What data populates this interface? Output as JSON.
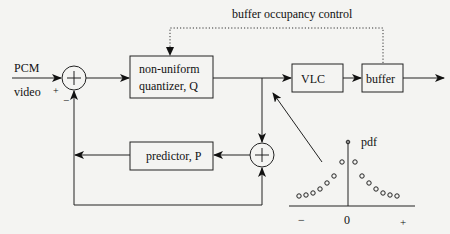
{
  "diagram": {
    "colors": {
      "background": "#f4f4f2",
      "stroke": "#222222",
      "text": "#111111"
    },
    "labels": {
      "buffer_control": "buffer occupancy control",
      "input_top": "PCM",
      "input_bottom": "video",
      "sum1_plus": "+",
      "sum1_minus": "−",
      "sum_glyph": "+",
      "pdf": "pdf",
      "axis_minus": "−",
      "axis_zero": "0",
      "axis_plus": "+"
    },
    "blocks": {
      "quantizer_line1": "non-uniform",
      "quantizer_line2": "quantizer, Q",
      "vlc": "VLC",
      "buffer": "buffer",
      "predictor": "predictor, P"
    },
    "pdf_points": [
      [
        299,
        196
      ],
      [
        306,
        195
      ],
      [
        313,
        193
      ],
      [
        320,
        189
      ],
      [
        327,
        183
      ],
      [
        334,
        176
      ],
      [
        342,
        162
      ],
      [
        355,
        162
      ],
      [
        362,
        176
      ],
      [
        369,
        183
      ],
      [
        376,
        189
      ],
      [
        383,
        193
      ],
      [
        390,
        195
      ],
      [
        397,
        196
      ]
    ]
  }
}
